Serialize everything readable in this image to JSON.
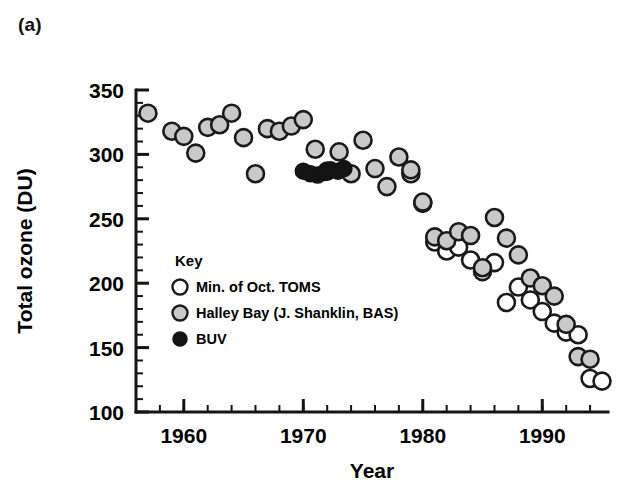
{
  "figure": {
    "panel_label": "(a)",
    "background_color": "#ffffff",
    "foreground_color": "#111111"
  },
  "legend": {
    "title": "Key",
    "position": "inside-lower-left",
    "entries": [
      {
        "label": "Min. of Oct. TOMS",
        "marker": "open-circle",
        "fill": "#ffffff",
        "stroke": "#1a1a1a"
      },
      {
        "label": "Halley Bay (J. Shanklin, BAS)",
        "marker": "gray-circle",
        "fill": "#c9c9c9",
        "stroke": "#1a1a1a"
      },
      {
        "label": "BUV",
        "marker": "filled-circle",
        "fill": "#141414",
        "stroke": "#141414"
      }
    ]
  },
  "chart_data": {
    "type": "scatter",
    "title": "",
    "xlabel": "Year",
    "ylabel": "Total ozone (DU)",
    "xlim": [
      1956,
      1995.5
    ],
    "ylim": [
      100,
      350
    ],
    "xticks": [
      1960,
      1970,
      1980,
      1990
    ],
    "xtick_labels": [
      "1960",
      "1970",
      "1980",
      "1990"
    ],
    "yticks": [
      100,
      150,
      200,
      250,
      300,
      350
    ],
    "ytick_labels": [
      "100",
      "150",
      "200",
      "250",
      "300",
      "350"
    ],
    "x_minor_tick_step": 2,
    "y_minor_tick_step": 10,
    "grid": false,
    "series": [
      {
        "name": "Halley Bay (J. Shanklin, BAS)",
        "marker": "gray-circle",
        "fill": "#c9c9c9",
        "stroke": "#1a1a1a",
        "points": [
          [
            1957,
            332
          ],
          [
            1959,
            318
          ],
          [
            1960,
            314
          ],
          [
            1961,
            301
          ],
          [
            1962,
            321
          ],
          [
            1963,
            323
          ],
          [
            1964,
            332
          ],
          [
            1965,
            313
          ],
          [
            1966,
            285
          ],
          [
            1967,
            320
          ],
          [
            1968,
            318
          ],
          [
            1969,
            322
          ],
          [
            1970,
            327
          ],
          [
            1971,
            304
          ],
          [
            1972,
            287
          ],
          [
            1973,
            302
          ],
          [
            1974,
            285
          ],
          [
            1975,
            311
          ],
          [
            1976,
            289
          ],
          [
            1977,
            275
          ],
          [
            1978,
            298
          ],
          [
            1979,
            288
          ],
          [
            1980,
            263
          ],
          [
            1981,
            236
          ],
          [
            1982,
            233
          ],
          [
            1983,
            240
          ],
          [
            1984,
            237
          ],
          [
            1985,
            212
          ],
          [
            1986,
            251
          ],
          [
            1987,
            235
          ],
          [
            1988,
            222
          ],
          [
            1989,
            204
          ],
          [
            1990,
            198
          ],
          [
            1991,
            190
          ],
          [
            1992,
            168
          ],
          [
            1993,
            143
          ],
          [
            1994,
            141
          ]
        ]
      },
      {
        "name": "Min. of Oct. TOMS",
        "marker": "open-circle",
        "fill": "#ffffff",
        "stroke": "#1a1a1a",
        "points": [
          [
            1979,
            285
          ],
          [
            1980,
            262
          ],
          [
            1981,
            232
          ],
          [
            1982,
            225
          ],
          [
            1983,
            228
          ],
          [
            1984,
            218
          ],
          [
            1985,
            209
          ],
          [
            1986,
            216
          ],
          [
            1987,
            185
          ],
          [
            1988,
            197
          ],
          [
            1989,
            187
          ],
          [
            1990,
            178
          ],
          [
            1991,
            169
          ],
          [
            1992,
            162
          ],
          [
            1993,
            160
          ],
          [
            1994,
            126
          ],
          [
            1995,
            124
          ]
        ]
      },
      {
        "name": "BUV",
        "marker": "filled-circle",
        "fill": "#141414",
        "stroke": "#141414",
        "points": [
          [
            1970,
            287
          ],
          [
            1970.6,
            285
          ],
          [
            1971.2,
            284
          ],
          [
            1971.8,
            286
          ],
          [
            1972.3,
            288
          ],
          [
            1972.9,
            287
          ],
          [
            1973.4,
            289
          ]
        ]
      }
    ]
  }
}
